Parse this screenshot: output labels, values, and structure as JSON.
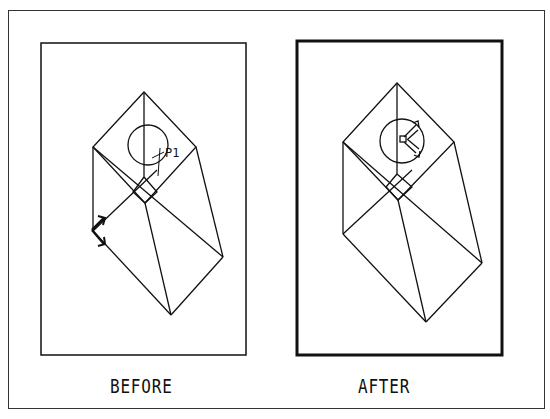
{
  "figure": {
    "panels": [
      {
        "id": "before",
        "caption": "BEFORE",
        "point_label": "P1",
        "frame": {
          "x": 41,
          "y": 43,
          "w": 205,
          "h": 312,
          "stroke": 1.5
        },
        "wireframe": {
          "apex_top": [
            144,
            92
          ],
          "left_top": [
            93,
            147
          ],
          "right_top": [
            196,
            147
          ],
          "center_top": [
            144,
            177
          ],
          "diamond_left": [
            133,
            192
          ],
          "diamond_right": [
            157,
            192
          ],
          "diamond_bottom": [
            145,
            203
          ],
          "left_bottom": [
            93,
            231
          ],
          "right_bottom": [
            223,
            257
          ],
          "apex_bottom": [
            171,
            315
          ],
          "circle": {
            "cx": 148,
            "cy": 145,
            "r": 20
          }
        }
      },
      {
        "id": "after",
        "caption": "AFTER",
        "frame": {
          "x": 297,
          "y": 41,
          "w": 205,
          "h": 314,
          "stroke": 3
        },
        "wireframe": {
          "apex_top": [
            397,
            83
          ],
          "left_top": [
            343,
            142
          ],
          "right_top": [
            454,
            142
          ],
          "center_top": [
            397,
            174
          ],
          "diamond_left": [
            386,
            187
          ],
          "diamond_right": [
            412,
            187
          ],
          "diamond_bottom": [
            398,
            200
          ],
          "left_bottom": [
            343,
            234
          ],
          "right_bottom": [
            482,
            263
          ],
          "apex_bottom": [
            426,
            322
          ],
          "circle": {
            "cx": 402,
            "cy": 141,
            "r": 22
          }
        }
      }
    ]
  }
}
